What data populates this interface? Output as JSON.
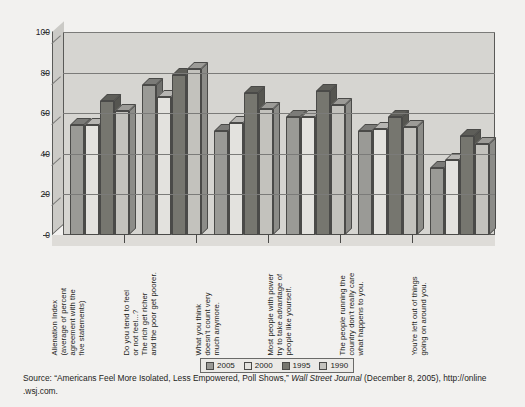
{
  "chart_data": {
    "type": "bar",
    "title": "",
    "subtitle": "",
    "xlabel": "",
    "ylabel": "",
    "ylim": [
      0,
      100
    ],
    "yticks": [
      0,
      20,
      40,
      60,
      80,
      100
    ],
    "grid": true,
    "legend_position": "bottom",
    "style": "3d-clustered-column",
    "categories": [
      "Alienation Index (average of percent agreement with the five statements)",
      "Do you tend to feel or not feel...? The rich get richer and the poor get poorer.",
      "What you think doesn't count very much anymore.",
      "Most people with power try to take advantage of people like yourself.",
      "The people running the country don't really care what happens to you.",
      "You're left out of things going on around you."
    ],
    "category_lines": [
      [
        "Alienation Index",
        "(average of percent",
        "agreement with the",
        "five statements)"
      ],
      [
        "Do you tend to feel",
        "or not feel...?",
        "The rich get richer",
        "and the poor get poorer."
      ],
      [
        "What you think",
        "doesn't count very",
        "much anymore."
      ],
      [
        "Most people with power",
        "try to take advantage of",
        "people like yourself."
      ],
      [
        "The people running the",
        "country don't really care",
        "what happens to you."
      ],
      [
        "You're left out of things",
        "going on around you."
      ]
    ],
    "series": [
      {
        "name": "2005",
        "color": "#9a9a96",
        "values": [
          54,
          74,
          51,
          58,
          51,
          33
        ]
      },
      {
        "name": "2000",
        "color": "#e3e2de",
        "values": [
          54,
          68,
          55,
          58,
          52,
          37
        ]
      },
      {
        "name": "1995",
        "color": "#76766f",
        "values": [
          66,
          79,
          70,
          71,
          58,
          49
        ]
      },
      {
        "name": "1990",
        "color": "#c3c2bd",
        "values": [
          61,
          82,
          62,
          64,
          53,
          45
        ]
      }
    ]
  },
  "legend": {
    "items": [
      {
        "label": "2005",
        "color": "#9a9a96"
      },
      {
        "label": "2000",
        "color": "#e3e2de"
      },
      {
        "label": "1995",
        "color": "#76766f"
      },
      {
        "label": "1990",
        "color": "#c3c2bd"
      }
    ]
  },
  "source": {
    "prefix": "Source: “Americans Feel More Isolated, Less Empowered, Poll Shows,” ",
    "publication": "Wall Street Journal",
    "suffix": " (December 8, 2005), http://online .wsj.com."
  },
  "colors": {
    "page_background": "#f2f1ef",
    "plot_background": "#d6d5d1",
    "axis": "#4a4a48",
    "gridline": "#7b7b79",
    "text": "#1d1d1b"
  }
}
